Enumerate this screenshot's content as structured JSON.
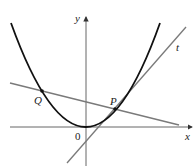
{
  "figure": {
    "type": "parabola-with-secant-and-tangent",
    "labels": {
      "x_axis": "x",
      "y_axis": "y",
      "origin": "0",
      "point_p": "P",
      "point_q": "Q",
      "tangent": "t"
    },
    "colors": {
      "curve": "#111111",
      "lines": "#777777",
      "axes": "#333333"
    },
    "elements": [
      {
        "name": "parabola",
        "description": "upward-opening parabola with vertex at origin"
      },
      {
        "name": "secant-line",
        "description": "line through Q and P with negative slope"
      },
      {
        "name": "tangent-line",
        "description": "line t tangent to parabola at P"
      },
      {
        "name": "point-Q",
        "description": "intersection of secant with left branch"
      },
      {
        "name": "point-P",
        "description": "point of tangency on right branch"
      }
    ]
  }
}
